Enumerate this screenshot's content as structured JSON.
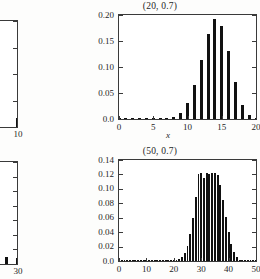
{
  "figure": {
    "background": "#fdfdfc",
    "bar_color": "#111111",
    "axis_color": "#3a3a3a",
    "layout": "2x2 grid of binomial pmf panels; left column clipped by image edge"
  },
  "chart_data": [
    {
      "id": "top-left-clipped",
      "type": "bar",
      "title": "",
      "xlabel": "",
      "ylabel": "",
      "clipped": true,
      "note": "Only the right portion of this panel is visible at the left edge of the screenshot.",
      "xlim": [
        6.2,
        10
      ],
      "ylim": [
        0.0,
        0.2
      ],
      "xticks": [
        10
      ],
      "xticklabels": [
        "10"
      ],
      "yticks": [
        0.0,
        0.05,
        0.1,
        0.15,
        0.2
      ],
      "yticklabels": [
        "",
        "",
        "",
        "",
        ""
      ],
      "x": [
        7,
        8,
        9,
        10
      ],
      "values": [
        0.0,
        0.0,
        0.081,
        0.0175
      ],
      "grid": false
    },
    {
      "id": "top-right",
      "type": "bar",
      "title": "(20, 0.7)",
      "xlabel": "x",
      "ylabel": "",
      "clipped": false,
      "xlim": [
        0,
        20
      ],
      "ylim": [
        0.0,
        0.2
      ],
      "xticks": [
        0,
        5,
        10,
        15,
        20
      ],
      "xticklabels": [
        "0",
        "5",
        "10",
        "15",
        "20"
      ],
      "yticks": [
        0.0,
        0.05,
        0.1,
        0.15,
        0.2
      ],
      "yticklabels": [
        "0.0",
        "0.05",
        "0.10",
        "0.15",
        "0.20"
      ],
      "x": [
        0,
        1,
        2,
        3,
        4,
        5,
        6,
        7,
        8,
        9,
        10,
        11,
        12,
        13,
        14,
        15,
        16,
        17,
        18,
        19,
        20
      ],
      "values": [
        0.0,
        0.0,
        0.0,
        0.0,
        0.0,
        0.0001,
        0.0002,
        0.001,
        0.0039,
        0.0123,
        0.0308,
        0.0654,
        0.1144,
        0.1643,
        0.1916,
        0.1789,
        0.1304,
        0.0716,
        0.0278,
        0.0068,
        0.0008
      ],
      "grid": false
    },
    {
      "id": "bottom-left-clipped",
      "type": "bar",
      "title": "",
      "xlabel": "",
      "ylabel": "",
      "clipped": true,
      "note": "Only the right portion of this panel is visible at the left edge of the screenshot.",
      "xlim": [
        22.5,
        30
      ],
      "ylim": [
        0.0,
        0.14
      ],
      "xticks": [
        25,
        30
      ],
      "xticklabels": [
        "5",
        "30"
      ],
      "yticks": [
        0.0,
        0.02,
        0.04,
        0.06,
        0.08,
        0.1,
        0.12,
        0.14
      ],
      "yticklabels": [
        "",
        "",
        "",
        "",
        "",
        "",
        "",
        ""
      ],
      "x": [
        23,
        24,
        25,
        26,
        27,
        28,
        29,
        30
      ],
      "values": [
        0.0,
        0.0,
        0.062,
        0.034,
        0.021,
        0.011,
        0.009,
        0.008
      ],
      "grid": false
    },
    {
      "id": "bottom-right",
      "type": "bar",
      "title": "(50, 0.7)",
      "xlabel": "",
      "ylabel": "",
      "clipped": false,
      "xlim": [
        0,
        50
      ],
      "ylim": [
        0.0,
        0.14
      ],
      "xticks": [
        0,
        10,
        20,
        30,
        40,
        50
      ],
      "xticklabels": [
        "0",
        "10",
        "20",
        "30",
        "40",
        "50"
      ],
      "yticks": [
        0.0,
        0.02,
        0.04,
        0.06,
        0.08,
        0.1,
        0.12,
        0.14
      ],
      "yticklabels": [
        "0.0",
        "0.02",
        "0.04",
        "0.06",
        "0.08",
        "0.10",
        "0.12",
        "0.14"
      ],
      "x": [
        0,
        1,
        2,
        3,
        4,
        5,
        6,
        7,
        8,
        9,
        10,
        11,
        12,
        13,
        14,
        15,
        16,
        17,
        18,
        19,
        20,
        21,
        22,
        23,
        24,
        25,
        26,
        27,
        28,
        29,
        30,
        31,
        32,
        33,
        34,
        35,
        36,
        37,
        38,
        39,
        40,
        41,
        42,
        43,
        44,
        45,
        46,
        47,
        48,
        49,
        50
      ],
      "values": [
        0.0,
        0.0,
        0.0,
        0.0,
        0.0,
        0.0,
        0.0,
        0.0,
        0.0,
        0.0,
        0.0,
        0.0,
        0.0,
        0.0,
        0.0,
        0.0,
        0.0,
        0.0,
        0.0001,
        0.0002,
        0.0004,
        0.0011,
        0.0026,
        0.0057,
        0.0115,
        0.0215,
        0.0372,
        0.0595,
        0.0881,
        0.1206,
        0.1219,
        0.1146,
        0.1219,
        0.1208,
        0.1219,
        0.1223,
        0.1188,
        0.1048,
        0.0843,
        0.0614,
        0.0402,
        0.0234,
        0.0119,
        0.0052,
        0.0019,
        0.0006,
        0.0001,
        0.0,
        0.0,
        0.0,
        0.0
      ],
      "grid": false
    }
  ],
  "labels": {
    "top_right_title": "(20, 0.7)",
    "bottom_right_title": "(50, 0.7)",
    "top_right_xaxis_name": "x",
    "top_left_xtick_10": "10",
    "bottom_left_xtick_5": "5",
    "bottom_left_xtick_30": "30"
  }
}
